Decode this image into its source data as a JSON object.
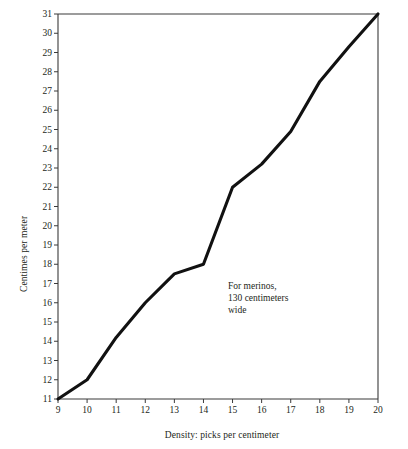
{
  "chart_data": {
    "type": "line",
    "title": "",
    "xlabel": "Density: picks per centimeter",
    "ylabel": "Centimes per meter",
    "xlim": [
      9,
      20
    ],
    "ylim": [
      11,
      31
    ],
    "grid": false,
    "legend": null,
    "xticks": [
      "9",
      "10",
      "11",
      "12",
      "13",
      "14",
      "15",
      "16",
      "17",
      "18",
      "19",
      "20"
    ],
    "yticks": [
      "11",
      "12",
      "13",
      "14",
      "15",
      "16",
      "17",
      "18",
      "19",
      "20",
      "21",
      "22",
      "23",
      "24",
      "25",
      "26",
      "27",
      "28",
      "29",
      "30",
      "31"
    ],
    "x": [
      9,
      10,
      11,
      12,
      13,
      14,
      15,
      16,
      17,
      18,
      19,
      20
    ],
    "values": [
      11,
      12,
      14.2,
      16,
      17.5,
      18,
      22,
      23.2,
      24.9,
      27.5,
      29.3,
      31
    ],
    "series": [
      {
        "name": "Centimes per meter",
        "values": [
          11,
          12,
          14.2,
          16,
          17.5,
          18,
          22,
          23.2,
          24.9,
          27.5,
          29.3,
          31
        ]
      }
    ],
    "annotations": [
      {
        "text": "For merinos,\n130 centimeters\nwide",
        "x": 15.5,
        "y": 20.0
      }
    ],
    "line_color": "#111111",
    "axis_color": "#3a3a3a"
  }
}
